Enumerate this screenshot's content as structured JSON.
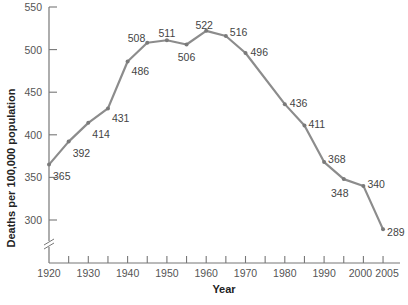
{
  "chart_data": {
    "type": "line",
    "title": "",
    "xlabel": "Year",
    "ylabel": "Deaths per 100,000 population",
    "x": [
      1920,
      1925,
      1930,
      1935,
      1940,
      1945,
      1950,
      1955,
      1960,
      1965,
      1970,
      1980,
      1985,
      1990,
      1995,
      2000,
      2005
    ],
    "series": [
      {
        "name": "Deaths per 100,000 population",
        "values": [
          365,
          392,
          414,
          431,
          486,
          508,
          511,
          506,
          522,
          516,
          496,
          436,
          411,
          368,
          348,
          340,
          289
        ]
      }
    ],
    "x_ticks": [
      "1920",
      "1930",
      "1940",
      "1950",
      "1960",
      "1970",
      "1980",
      "1990",
      "2000",
      "2005"
    ],
    "y_ticks": [
      "300",
      "350",
      "400",
      "450",
      "500",
      "550"
    ],
    "ylim": [
      300,
      550
    ],
    "xlim": [
      1920,
      2005
    ],
    "y_axis_break": true,
    "grid": false,
    "legend": "none",
    "line_color": "#8c8c8c"
  },
  "labels": {
    "xlabel": "Year",
    "ylabel": "Deaths per 100,000 population"
  }
}
